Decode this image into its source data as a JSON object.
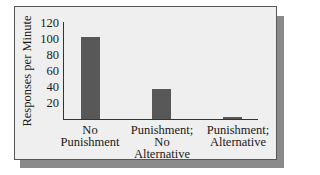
{
  "chart_data": {
    "type": "bar",
    "title": "",
    "xlabel": "",
    "ylabel": "Responses per Minute",
    "categories": [
      "No\nPunishment",
      "Punishment;\nNo\nAlternative",
      "Punishment;\nAlternative"
    ],
    "values": [
      102,
      38,
      2
    ],
    "ylim": [
      0,
      120
    ],
    "yticks": [
      "120",
      "100",
      "80",
      "60",
      "40",
      "20"
    ],
    "grid": false,
    "legend": null,
    "bar_color": "#585858",
    "background_color": "#efefef"
  }
}
